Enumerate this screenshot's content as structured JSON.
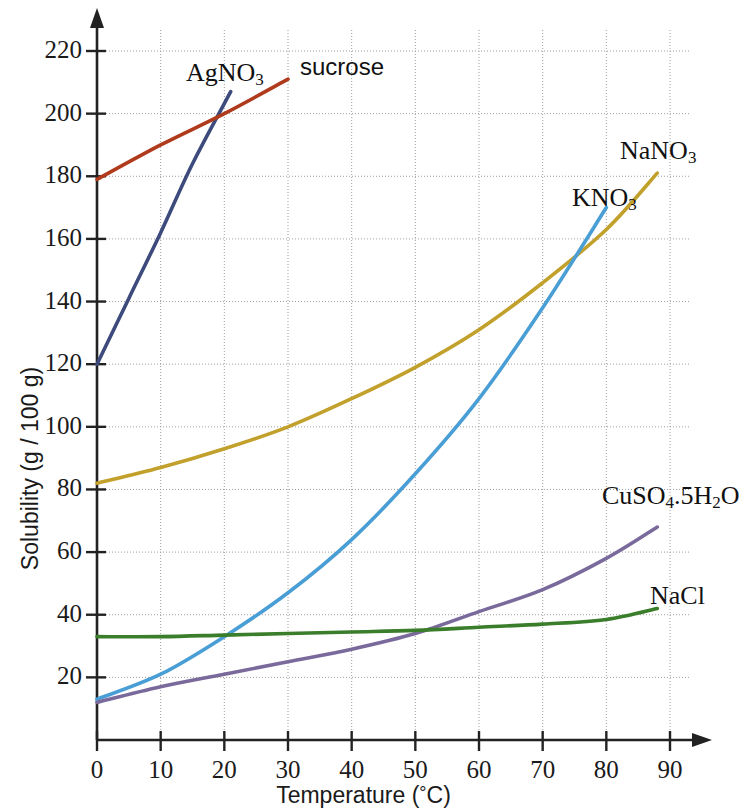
{
  "chart_data": {
    "type": "line",
    "title": "",
    "xlabel": "Temperature (°C)",
    "ylabel": "Solubility (g / 100 g)",
    "xlim": [
      0,
      93
    ],
    "ylim": [
      0,
      232
    ],
    "grid": true,
    "legend_position": "inline-labels",
    "x_ticks": [
      0,
      10,
      20,
      30,
      40,
      50,
      60,
      70,
      80,
      90
    ],
    "y_ticks": [
      20,
      40,
      60,
      80,
      100,
      120,
      140,
      160,
      180,
      200,
      220
    ],
    "series": [
      {
        "name": "AgNO3",
        "label": "AgNO",
        "label_sub": "3",
        "color": "#3c4a7c",
        "x": [
          0,
          5,
          10,
          15,
          21
        ],
        "values": [
          120,
          141,
          162,
          184,
          207
        ]
      },
      {
        "name": "sucrose",
        "label": "sucrose",
        "label_sub": "",
        "color": "#b03a1c",
        "x": [
          0,
          10,
          20,
          30
        ],
        "values": [
          179,
          190,
          200,
          211
        ]
      },
      {
        "name": "NaNO3",
        "label": "NaNO",
        "label_sub": "3",
        "color": "#c2a02c",
        "x": [
          0,
          10,
          20,
          30,
          40,
          50,
          60,
          70,
          80,
          88
        ],
        "values": [
          82,
          87,
          93,
          100,
          109,
          119,
          131,
          146,
          163,
          181
        ]
      },
      {
        "name": "KNO3",
        "label": "KNO",
        "label_sub": "3",
        "color": "#4a9ed6",
        "x": [
          0,
          10,
          20,
          30,
          40,
          50,
          60,
          70,
          80
        ],
        "values": [
          13,
          21,
          33,
          47,
          64,
          85,
          109,
          138,
          170
        ]
      },
      {
        "name": "CuSO4.5H2O",
        "label_parts": [
          "CuSO",
          "4",
          ".5H",
          "2",
          "O"
        ],
        "color": "#7a6a9c",
        "x": [
          0,
          10,
          20,
          30,
          40,
          50,
          60,
          70,
          80,
          88
        ],
        "values": [
          12,
          17,
          21,
          25,
          29,
          34,
          41,
          48,
          58,
          68
        ]
      },
      {
        "name": "NaCl",
        "label": "NaCl",
        "label_sub": "",
        "color": "#3a7d2a",
        "x": [
          0,
          10,
          20,
          30,
          40,
          50,
          60,
          70,
          80,
          88
        ],
        "values": [
          33,
          33,
          33.5,
          34,
          34.5,
          35,
          36,
          37,
          38.5,
          42
        ]
      }
    ],
    "annotations": [
      {
        "name": "AgNO3-label",
        "text": "AgNO",
        "sub": "3",
        "x_px": 186,
        "y_px": 58
      },
      {
        "name": "sucrose-label",
        "text": "sucrose",
        "sub": "",
        "x_px": 300,
        "y_px": 53
      },
      {
        "name": "NaNO3-label",
        "text": "NaNO",
        "sub": "3",
        "x_px": 620,
        "y_px": 136
      },
      {
        "name": "KNO3-label",
        "text": "KNO",
        "sub": "3",
        "x_px": 572,
        "y_px": 183
      },
      {
        "name": "CuSO4-label",
        "text": "CuSO4.5H2O",
        "sub": "",
        "x_px": 602,
        "y_px": 481
      },
      {
        "name": "NaCl-label",
        "text": "NaCl",
        "sub": "",
        "x_px": 650,
        "y_px": 581
      }
    ]
  },
  "axes": {
    "x_title": "Temperature (",
    "x_title_unit": "°",
    "x_title_end": "C)",
    "y_title": "Solubility (g / 100 g)",
    "x_tick_labels": [
      "0",
      "10",
      "20",
      "30",
      "40",
      "50",
      "60",
      "70",
      "80",
      "90"
    ],
    "y_tick_labels": [
      "220",
      "200",
      "180",
      "160",
      "140",
      "120",
      "100",
      "80",
      "60",
      "40",
      "20"
    ]
  },
  "colors": {
    "grid": "#9a9a9a",
    "axis": "#222222",
    "text": "#1a1a1a",
    "background": "#ffffff"
  }
}
